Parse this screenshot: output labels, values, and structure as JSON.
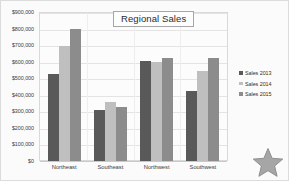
{
  "chart_data": {
    "type": "bar",
    "title": "Regional Sales",
    "xlabel": "",
    "ylabel": "",
    "categories": [
      "Northeast",
      "Southeast",
      "Northwest",
      "Southwest"
    ],
    "series": [
      {
        "name": "Sales 2013",
        "color": "#595959",
        "values": [
          525000,
          308000,
          605000,
          420000
        ]
      },
      {
        "name": "Sales 2014",
        "color": "#bfbfbf",
        "values": [
          695000,
          357000,
          598000,
          545000
        ]
      },
      {
        "name": "Sales 2015",
        "color": "#8c8c8c",
        "values": [
          795000,
          327000,
          620000,
          620000
        ]
      }
    ],
    "ylim": [
      0,
      900000
    ],
    "ytick_step": 100000,
    "ytick_labels": [
      "$900,000",
      "$800,000",
      "$700,000",
      "$600,000",
      "$500,000",
      "$400,000",
      "$300,000",
      "$200,000",
      "$100,000",
      "$0"
    ],
    "ytick_values": [
      900000,
      800000,
      700000,
      600000,
      500000,
      400000,
      300000,
      200000,
      100000,
      0
    ],
    "grid": true,
    "legend_position": "right"
  },
  "overlay": {
    "star_icon": "star-icon",
    "star_fill": "#a6a6a6",
    "star_stroke": "#8f8f8f"
  }
}
